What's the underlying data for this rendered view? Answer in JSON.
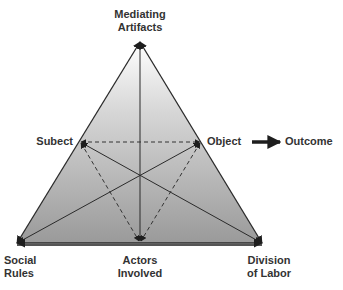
{
  "diagram": {
    "nodes": {
      "mediating_artifacts": {
        "line1": "Mediating",
        "line2": "Artifacts"
      },
      "subject": {
        "label": "Subect"
      },
      "object": {
        "label": "Object"
      },
      "outcome": {
        "label": "Outcome"
      },
      "social_rules": {
        "line1": "Social",
        "line2": "Rules"
      },
      "actors_involved": {
        "line1": "Actors",
        "line2": "Involved"
      },
      "division_of_labor": {
        "line1": "Division",
        "line2": "of Labor"
      }
    },
    "colors": {
      "gradient_top": "#ffffff",
      "gradient_bottom": "#9a9a9a",
      "line": "#2a2a2a",
      "text": "#333333"
    },
    "edges": [
      {
        "from": "mediating_artifacts",
        "to": "social_rules",
        "style": "solid"
      },
      {
        "from": "mediating_artifacts",
        "to": "division_of_labor",
        "style": "solid"
      },
      {
        "from": "mediating_artifacts",
        "to": "actors_involved",
        "style": "solid"
      },
      {
        "from": "social_rules",
        "to": "division_of_labor",
        "style": "solid"
      },
      {
        "from": "subject",
        "to": "object",
        "style": "dashed"
      },
      {
        "from": "subject",
        "to": "actors_involved",
        "style": "dashed"
      },
      {
        "from": "object",
        "to": "actors_involved",
        "style": "dashed"
      },
      {
        "from": "subject",
        "to": "division_of_labor",
        "style": "solid"
      },
      {
        "from": "object",
        "to": "social_rules",
        "style": "solid"
      },
      {
        "from": "object",
        "to": "outcome",
        "style": "thick-arrow"
      }
    ]
  }
}
